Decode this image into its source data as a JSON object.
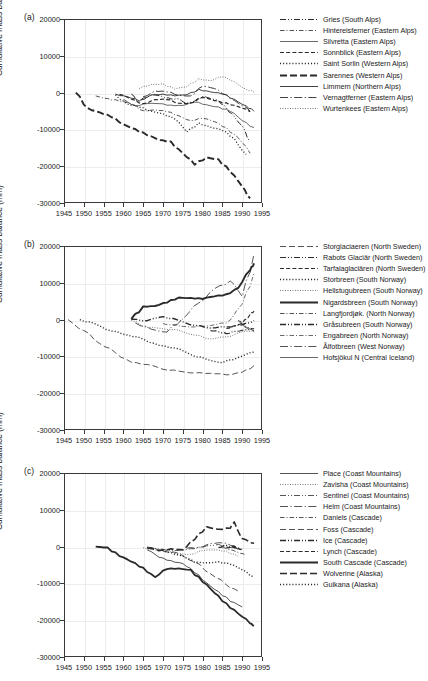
{
  "figure": {
    "axis": {
      "ylabel": "Cumulative mass balance (mm)",
      "yticks": [
        "20000",
        "10000",
        "0",
        "-10000",
        "-20000",
        "-30000"
      ],
      "xticks": [
        "1945",
        "1950",
        "1955",
        "1960",
        "1965",
        "1970",
        "1975",
        "1980",
        "1985",
        "1990",
        "1995"
      ],
      "ylim": [
        -30000,
        20000
      ],
      "xlim": [
        1945,
        1995
      ]
    },
    "panels": [
      {
        "id": "a",
        "label": "(a)"
      },
      {
        "id": "b",
        "label": "(b)"
      },
      {
        "id": "c",
        "label": "(c)"
      }
    ]
  },
  "chart_data": [
    {
      "type": "line",
      "panel": "(a)",
      "title": "",
      "xlabel": "",
      "ylabel": "Cumulative mass balance (mm)",
      "xlim": [
        1945,
        1995
      ],
      "ylim": [
        -30000,
        20000
      ],
      "grid": true,
      "legend_position": "right",
      "series": [
        {
          "name": "Gries (South Alps)",
          "style": "dash-dot-dot",
          "width": 1.0,
          "x": [
            1962,
            1964,
            1966,
            1968,
            1970,
            1972,
            1974,
            1976,
            1978,
            1980,
            1982,
            1984,
            1986,
            1988,
            1990,
            1992
          ],
          "values": [
            -400,
            -2600,
            -1200,
            -600,
            -1200,
            -1700,
            -1700,
            -2900,
            -2300,
            -1100,
            -1600,
            -2200,
            -4200,
            -6500,
            -9000,
            -13300
          ]
        },
        {
          "name": "Hintereisferner (Eastern Alps)",
          "style": "dash-dot-fine",
          "width": 0.8,
          "x": [
            1953,
            1956,
            1959,
            1962,
            1965,
            1968,
            1971,
            1974,
            1977,
            1980,
            1983,
            1986,
            1989,
            1992
          ],
          "values": [
            -900,
            -1600,
            -2300,
            -3100,
            -4900,
            -4700,
            -5200,
            -6300,
            -7600,
            -7000,
            -7900,
            -9500,
            -12300,
            -16500
          ]
        },
        {
          "name": "Silvretta (Eastern Alps)",
          "style": "solid-thin",
          "width": 0.7,
          "x": [
            1960,
            1963,
            1966,
            1969,
            1972,
            1975,
            1978,
            1981,
            1984,
            1987,
            1990,
            1993
          ],
          "values": [
            -1800,
            -3600,
            -3000,
            -3000,
            -3400,
            -3500,
            -2600,
            -3300,
            -3900,
            -5100,
            -7600,
            -9500
          ]
        },
        {
          "name": "Sonnblick (Eastern Alps)",
          "style": "dashed",
          "width": 1.2,
          "x": [
            1959,
            1962,
            1965,
            1968,
            1971,
            1974,
            1977,
            1980,
            1983,
            1986,
            1989,
            1992
          ],
          "values": [
            -500,
            -1800,
            -3000,
            -1900,
            -1900,
            -2900,
            -2900,
            -1300,
            -2200,
            -2800,
            -3800,
            -5200
          ]
        },
        {
          "name": "Saint Sorlin (Western Alps)",
          "style": "dotted",
          "width": 1.3,
          "x": [
            1958,
            1961,
            1964,
            1967,
            1970,
            1973,
            1976,
            1979,
            1982,
            1985,
            1988,
            1991
          ],
          "values": [
            -600,
            -3100,
            -4000,
            -5000,
            -5700,
            -7200,
            -10700,
            -8200,
            -9400,
            -10300,
            -12500,
            -16800
          ]
        },
        {
          "name": "Sarennes (Western Alps)",
          "style": "dash-long",
          "width": 1.9,
          "x": [
            1948,
            1951,
            1954,
            1957,
            1960,
            1963,
            1966,
            1969,
            1972,
            1975,
            1978,
            1981,
            1984,
            1987,
            1990,
            1992
          ],
          "values": [
            0,
            -4200,
            -5400,
            -6700,
            -8600,
            -9900,
            -11600,
            -12900,
            -13300,
            -16500,
            -19600,
            -17600,
            -18100,
            -21600,
            -25500,
            -28700
          ]
        },
        {
          "name": "Limmern (Northern Alps)",
          "style": "solid",
          "width": 0.9,
          "x": [
            1958,
            1961,
            1964,
            1967,
            1970,
            1973,
            1976,
            1979,
            1982,
            1985,
            1988,
            1991,
            1993
          ],
          "values": [
            -400,
            -1100,
            -2300,
            -600,
            -400,
            -900,
            -600,
            900,
            200,
            -400,
            -1800,
            -3600,
            -5100
          ]
        },
        {
          "name": "Vernagtferner (Eastern Alps)",
          "style": "dash-dot-long",
          "width": 0.9,
          "x": [
            1965,
            1968,
            1971,
            1974,
            1977,
            1980,
            1983,
            1986,
            1989,
            1992
          ],
          "values": [
            -1100,
            400,
            200,
            -700,
            -900,
            1700,
            1100,
            -600,
            -2900,
            -5000
          ]
        },
        {
          "name": "Wurtenkees (Eastern Alps)",
          "style": "dotted-fine",
          "width": 0.7,
          "x": [
            1964,
            1967,
            1970,
            1973,
            1976,
            1979,
            1982,
            1985,
            1988,
            1991,
            1993
          ],
          "values": [
            1100,
            2200,
            2400,
            900,
            1600,
            3800,
            3200,
            4300,
            3000,
            900,
            100
          ]
        }
      ]
    },
    {
      "type": "line",
      "panel": "(b)",
      "title": "",
      "xlabel": "",
      "ylabel": "Cumulative mass balance (mm)",
      "xlim": [
        1945,
        1995
      ],
      "ylim": [
        -30000,
        20000
      ],
      "grid": true,
      "legend_position": "right",
      "series": [
        {
          "name": "Storglaciaeren (North Sweden)",
          "style": "dash-long-fine",
          "width": 0.8,
          "x": [
            1946,
            1950,
            1954,
            1958,
            1962,
            1966,
            1970,
            1974,
            1978,
            1982,
            1986,
            1990,
            1993
          ],
          "values": [
            0,
            -3000,
            -6500,
            -9000,
            -11600,
            -12200,
            -13500,
            -14000,
            -14500,
            -14600,
            -15000,
            -14300,
            -12500
          ]
        },
        {
          "name": "Rabots Glaciär (North Sweden)",
          "style": "dash-dot-dot",
          "width": 1.2,
          "x": [
            1982,
            1984,
            1986,
            1988,
            1990,
            1992,
            1993
          ],
          "values": [
            -3000,
            -3300,
            -3800,
            -3200,
            -2900,
            -2600,
            -2400
          ]
        },
        {
          "name": "Tarfalaglaciären (North Sweden)",
          "style": "dashed",
          "width": 1.1,
          "x": [
            1986,
            1988,
            1990,
            1992,
            1993
          ],
          "values": [
            -2400,
            -1700,
            -900,
            1400,
            2300
          ]
        },
        {
          "name": "Storbreen (South Norway)",
          "style": "dotted",
          "width": 1.4,
          "x": [
            1949,
            1953,
            1957,
            1961,
            1965,
            1969,
            1973,
            1977,
            1981,
            1985,
            1989,
            1993
          ],
          "values": [
            0,
            -1200,
            -3100,
            -4200,
            -5300,
            -7000,
            -7700,
            -9500,
            -10800,
            -11700,
            -10300,
            -8800
          ]
        },
        {
          "name": "Hellstugubreen (South Norway)",
          "style": "dotted-fine",
          "width": 0.7,
          "x": [
            1962,
            1966,
            1970,
            1974,
            1978,
            1982,
            1986,
            1990,
            1993
          ],
          "values": [
            -200,
            -2100,
            -2500,
            -2900,
            -4200,
            -5300,
            -4700,
            -3300,
            -2900
          ]
        },
        {
          "name": "Nigardsbreen (South Norway)",
          "style": "solid-bold",
          "width": 1.9,
          "x": [
            1962,
            1965,
            1968,
            1971,
            1974,
            1977,
            1980,
            1983,
            1986,
            1989,
            1992,
            1993
          ],
          "values": [
            200,
            3600,
            3700,
            4600,
            6000,
            5900,
            5600,
            6300,
            6900,
            8600,
            13400,
            15300
          ]
        },
        {
          "name": "Langfjordjøk. (North Norway)",
          "style": "dash-dot-fine",
          "width": 0.8,
          "x": [
            1989,
            1990,
            1991,
            1992,
            1993
          ],
          "values": [
            -200,
            -900,
            -1900,
            -2600,
            -3200
          ]
        },
        {
          "name": "Gråsubreen (South Norway)",
          "style": "dash-dot-dot-bold",
          "width": 1.4,
          "x": [
            1962,
            1966,
            1970,
            1974,
            1978,
            1982,
            1986,
            1990,
            1993
          ],
          "values": [
            100,
            -300,
            800,
            -200,
            -1600,
            -2300,
            -2000,
            -1400,
            -300
          ]
        },
        {
          "name": "Engabreen (North Norway)",
          "style": "dash-dot-fine",
          "width": 0.7,
          "x": [
            1970,
            1974,
            1978,
            1982,
            1986,
            1990,
            1993
          ],
          "values": [
            -1100,
            -1700,
            -2000,
            -1600,
            -900,
            4200,
            12800
          ]
        },
        {
          "name": "Ålfotbreen (West Norway)",
          "style": "dash-dot-long",
          "width": 0.8,
          "x": [
            1963,
            1967,
            1971,
            1975,
            1979,
            1983,
            1987,
            1990,
            1993
          ],
          "values": [
            -900,
            -2600,
            -3400,
            200,
            4500,
            8400,
            10500,
            6300,
            17900
          ]
        },
        {
          "name": "Hofsjökul N (Central Iceland)",
          "style": "solid-thin",
          "width": 0.7,
          "x": [
            1989,
            1990,
            1991,
            1992,
            1993
          ],
          "values": [
            -400,
            -1200,
            -2200,
            -2600,
            -3000
          ]
        }
      ]
    },
    {
      "type": "line",
      "panel": "(c)",
      "title": "",
      "xlabel": "",
      "ylabel": "Cumulative mass balance (mm)",
      "xlim": [
        1945,
        1995
      ],
      "ylim": [
        -30000,
        20000
      ],
      "grid": true,
      "legend_position": "right",
      "series": [
        {
          "name": "Place (Coast Mountains)",
          "style": "solid-thin",
          "width": 0.8,
          "x": [
            1966,
            1969,
            1972,
            1975,
            1978,
            1981,
            1984,
            1987,
            1990
          ],
          "values": [
            -900,
            -2900,
            -3800,
            -4600,
            -7100,
            -9800,
            -12200,
            -14900,
            -16400
          ]
        },
        {
          "name": "Zavisha (Coast Mountains)",
          "style": "dotted-fine",
          "width": 0.7,
          "x": [
            1965,
            1968,
            1971,
            1974,
            1977,
            1980,
            1983,
            1986,
            1989
          ],
          "values": [
            -300,
            -900,
            -1400,
            -1900,
            -2100,
            -1100,
            -900,
            -1200,
            -2600
          ]
        },
        {
          "name": "Sentinel (Coast Mountains)",
          "style": "dash-dot-dot",
          "width": 0.8,
          "x": [
            1966,
            1969,
            1972,
            1975,
            1978,
            1981,
            1984,
            1987,
            1989
          ],
          "values": [
            -200,
            -700,
            -1000,
            -900,
            -600,
            200,
            600,
            -200,
            -700
          ]
        },
        {
          "name": "Helm  (Coast Mountains)",
          "style": "dash-dot-long",
          "width": 0.8,
          "x": [
            1976,
            1979,
            1982,
            1985,
            1988,
            1990
          ],
          "values": [
            -400,
            -200,
            800,
            1000,
            200,
            -600
          ]
        },
        {
          "name": "Daniels (Cascade)",
          "style": "dash-dot-fine",
          "width": 0.8,
          "x": [
            1985,
            1987,
            1989,
            1991
          ],
          "values": [
            -300,
            -900,
            -1600,
            -2400
          ]
        },
        {
          "name": "Foss (Cascade)",
          "style": "dash-long-fine",
          "width": 0.8,
          "x": [
            1970,
            1974,
            1978,
            1982,
            1986,
            1989
          ],
          "values": [
            -1200,
            -1800,
            -4200,
            -7400,
            -10400,
            -12100
          ]
        },
        {
          "name": "Ice (Cascade)",
          "style": "dash-dot-dot-bold",
          "width": 1.4,
          "x": [
            1984,
            1986,
            1988,
            1990
          ],
          "values": [
            -200,
            300,
            -200,
            -800
          ]
        },
        {
          "name": "Lynch (Cascade)",
          "style": "dashed",
          "width": 1.2,
          "x": [
            1986,
            1988,
            1990
          ],
          "values": [
            -300,
            100,
            -900
          ]
        },
        {
          "name": "South Cascade (Cascade)",
          "style": "solid-bold",
          "width": 1.8,
          "x": [
            1953,
            1956,
            1959,
            1962,
            1965,
            1968,
            1971,
            1974,
            1977,
            1980,
            1983,
            1986,
            1989,
            1992,
            1993
          ],
          "values": [
            0,
            -200,
            -2600,
            -4100,
            -5700,
            -8300,
            -6100,
            -5900,
            -6300,
            -9600,
            -12600,
            -15400,
            -18200,
            -20900,
            -21500
          ]
        },
        {
          "name": "Wolverine (Alaska)",
          "style": "dash-long",
          "width": 1.6,
          "x": [
            1966,
            1969,
            1972,
            1975,
            1978,
            1981,
            1984,
            1987,
            1988,
            1990,
            1993
          ],
          "values": [
            -400,
            -1100,
            -600,
            -900,
            1900,
            5400,
            4700,
            5000,
            6700,
            2200,
            900
          ]
        },
        {
          "name": "Gulkana (Alaska)",
          "style": "dotted",
          "width": 1.4,
          "x": [
            1966,
            1969,
            1972,
            1975,
            1978,
            1981,
            1984,
            1987,
            1990,
            1993
          ],
          "values": [
            -200,
            -900,
            -1600,
            -2600,
            -4300,
            -4400,
            -4100,
            -4800,
            -6300,
            -8200
          ]
        }
      ]
    }
  ]
}
